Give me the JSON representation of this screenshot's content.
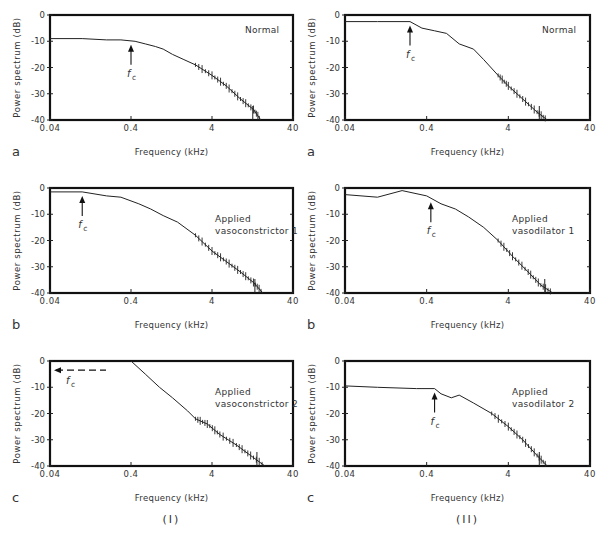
{
  "figure": {
    "column_labels": [
      "(I)",
      "(II)"
    ],
    "x_axis_label": "Frequency (kHz)",
    "y_axis_label": "Power spectrum (dB)",
    "x_ticks": [
      "0.04",
      "0.4",
      "4",
      "40"
    ],
    "y_ticks": [
      "0",
      "-10",
      "-20",
      "-30",
      "-40"
    ],
    "cutoff_label": "f",
    "cutoff_subscript": "c"
  },
  "chart_data": [
    {
      "id": "I-a",
      "type": "line",
      "panel_letter": "a",
      "column": "(I)",
      "title": "Normal",
      "title_lines": [
        "Normal"
      ],
      "xlabel": "Frequency (kHz)",
      "ylabel": "Power spectrum (dB)",
      "xscale": "log",
      "xlim": [
        0.04,
        40
      ],
      "ylim": [
        -40,
        0
      ],
      "cutoff_fc_khz": 0.4,
      "cutoff_arrow": "up",
      "x": [
        0.04,
        0.1,
        0.2,
        0.3,
        0.45,
        0.6,
        0.8,
        1.0,
        1.3,
        1.8,
        2.5,
        4,
        6,
        9,
        13,
        16
      ],
      "y": [
        -9,
        -9,
        -9.5,
        -9.5,
        -10,
        -11,
        -12,
        -13,
        -15,
        -17,
        -19,
        -23,
        -27,
        -32,
        -36,
        -40
      ]
    },
    {
      "id": "I-b",
      "type": "line",
      "panel_letter": "b",
      "column": "(I)",
      "title": "Applied vasoconstrictor 1",
      "title_lines": [
        "Applied",
        "vasoconstrictor 1"
      ],
      "xlabel": "Frequency (kHz)",
      "ylabel": "Power spectrum (dB)",
      "xscale": "log",
      "xlim": [
        0.04,
        40
      ],
      "ylim": [
        -40,
        0
      ],
      "cutoff_fc_khz": 0.1,
      "cutoff_arrow": "up",
      "x": [
        0.04,
        0.1,
        0.2,
        0.3,
        0.5,
        0.7,
        1.0,
        1.5,
        2.5,
        4,
        6,
        9,
        13,
        17
      ],
      "y": [
        -1.5,
        -1.5,
        -3,
        -3.5,
        -6,
        -8,
        -10.5,
        -13,
        -18,
        -24,
        -28,
        -32,
        -36,
        -40
      ]
    },
    {
      "id": "I-c",
      "type": "line",
      "panel_letter": "c",
      "column": "(I)",
      "title": "Applied vasoconstrictor 2",
      "title_lines": [
        "Applied",
        "vasoconstrictor 2"
      ],
      "xlabel": "Frequency (kHz)",
      "ylabel": "Power spectrum (dB)",
      "xscale": "log",
      "xlim": [
        0.04,
        40
      ],
      "ylim": [
        -40,
        0
      ],
      "cutoff_fc_khz": "< 0.04",
      "cutoff_arrow": "left (dashed)",
      "x": [
        0.4,
        0.6,
        0.9,
        1.3,
        2.0,
        2.5,
        3.5,
        5,
        8,
        12,
        18
      ],
      "y": [
        0,
        -5,
        -10,
        -14,
        -19,
        -22,
        -24,
        -28,
        -32,
        -36,
        -40
      ]
    },
    {
      "id": "II-a",
      "type": "line",
      "panel_letter": "a",
      "column": "(II)",
      "title": "Normal",
      "title_lines": [
        "Normal"
      ],
      "xlabel": "Frequency (kHz)",
      "ylabel": "Power spectrum (dB)",
      "xscale": "log",
      "xlim": [
        0.04,
        40
      ],
      "ylim": [
        -40,
        0
      ],
      "cutoff_fc_khz": 0.25,
      "cutoff_arrow": "up",
      "x": [
        0.04,
        0.1,
        0.25,
        0.35,
        0.5,
        0.7,
        1.0,
        1.5,
        2.0,
        3.0,
        4,
        6,
        9,
        12
      ],
      "y": [
        -2.5,
        -2.5,
        -2.5,
        -5,
        -6,
        -7,
        -11,
        -13,
        -17,
        -23,
        -27,
        -32,
        -37,
        -40
      ]
    },
    {
      "id": "II-b",
      "type": "line",
      "panel_letter": "b",
      "column": "(II)",
      "title": "Applied vasodilator 1",
      "title_lines": [
        "Applied",
        "vasodilator 1"
      ],
      "xlabel": "Frequency (kHz)",
      "ylabel": "Power spectrum (dB)",
      "xscale": "log",
      "xlim": [
        0.04,
        40
      ],
      "ylim": [
        -40,
        0
      ],
      "cutoff_fc_khz": 0.45,
      "cutoff_arrow": "up",
      "x": [
        0.04,
        0.1,
        0.2,
        0.4,
        0.6,
        0.9,
        1.3,
        2.0,
        3.0,
        4.5,
        7,
        10,
        14
      ],
      "y": [
        -2.5,
        -3.5,
        -1,
        -3,
        -6,
        -8,
        -11,
        -15,
        -20,
        -26,
        -32,
        -37,
        -40
      ]
    },
    {
      "id": "II-c",
      "type": "line",
      "panel_letter": "c",
      "column": "(II)",
      "title": "Applied vasodilator 2",
      "title_lines": [
        "Applied",
        "vasodilator 2"
      ],
      "xlabel": "Frequency (kHz)",
      "ylabel": "Power spectrum (dB)",
      "xscale": "log",
      "xlim": [
        0.04,
        40
      ],
      "ylim": [
        -40,
        0
      ],
      "cutoff_fc_khz": 0.5,
      "cutoff_arrow": "up",
      "x": [
        0.04,
        0.1,
        0.3,
        0.5,
        0.6,
        0.8,
        1.0,
        1.5,
        2.5,
        4,
        6,
        9,
        12
      ],
      "y": [
        -9.5,
        -10,
        -10.5,
        -10.5,
        -12.5,
        -14,
        -13,
        -16,
        -20,
        -25,
        -30,
        -36,
        -40
      ]
    }
  ]
}
